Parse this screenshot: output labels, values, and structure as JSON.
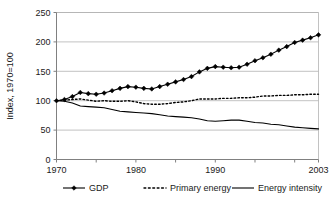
{
  "chart_data": {
    "type": "line",
    "title": "",
    "xlabel": "",
    "ylabel": "Index, 1970=100",
    "xlim": [
      1970,
      2003
    ],
    "ylim": [
      0,
      250
    ],
    "yticks": [
      0,
      50,
      100,
      150,
      200,
      250
    ],
    "ytick_labels": [
      "0",
      "50",
      "100",
      "150",
      "200",
      "250"
    ],
    "xticks": [
      1970,
      1980,
      1990,
      2003
    ],
    "xtick_labels": [
      "1970",
      "1980",
      "1990",
      "2003"
    ],
    "x_minor_ticks": [
      1975,
      1985,
      1995,
      2000
    ],
    "grid": "horizontal",
    "legend_position": "bottom",
    "x": [
      1970,
      1971,
      1972,
      1973,
      1974,
      1975,
      1976,
      1977,
      1978,
      1979,
      1980,
      1981,
      1982,
      1983,
      1984,
      1985,
      1986,
      1987,
      1988,
      1989,
      1990,
      1991,
      1992,
      1993,
      1994,
      1995,
      1996,
      1997,
      1998,
      1999,
      2000,
      2001,
      2002,
      2003
    ],
    "series": [
      {
        "name": "GDP",
        "style": "line-marker",
        "marker": "diamond",
        "color": "#000000",
        "values": [
          100,
          102,
          107,
          114,
          112,
          111,
          113,
          117,
          121,
          124,
          123,
          121,
          120,
          124,
          128,
          132,
          136,
          141,
          149,
          155,
          158,
          157,
          156,
          157,
          162,
          168,
          173,
          179,
          186,
          192,
          199,
          203,
          207,
          212
        ]
      },
      {
        "name": "Primary energy",
        "style": "dotted",
        "color": "#000000",
        "values": [
          100,
          101,
          102,
          103,
          101,
          99,
          100,
          99,
          99,
          100,
          98,
          95,
          94,
          94,
          95,
          97,
          98,
          100,
          103,
          103,
          103,
          104,
          104,
          105,
          105,
          106,
          108,
          108,
          109,
          109,
          110,
          110,
          111,
          111
        ]
      },
      {
        "name": "Energy intensity",
        "style": "solid",
        "color": "#000000",
        "values": [
          100,
          99,
          96,
          91,
          90,
          89,
          88,
          85,
          82,
          81,
          80,
          79,
          78,
          76,
          74,
          73,
          72,
          71,
          69,
          66,
          65,
          66,
          67,
          67,
          65,
          63,
          62,
          60,
          59,
          57,
          55,
          54,
          53,
          52
        ]
      }
    ]
  },
  "legend": {
    "items": [
      {
        "label": "GDP",
        "style": "line-marker"
      },
      {
        "label": "Primary energy",
        "style": "dotted"
      },
      {
        "label": "Energy intensity",
        "style": "solid"
      }
    ]
  }
}
